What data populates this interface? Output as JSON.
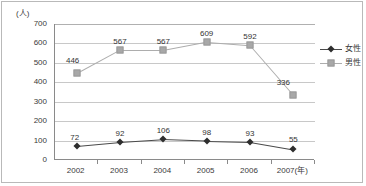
{
  "chart_data": {
    "type": "line",
    "title": "",
    "xlabel": "(年)",
    "ylabel": "(人)",
    "ylim": [
      0,
      700
    ],
    "ystep": 100,
    "grid": true,
    "legend_position": "right",
    "categories": [
      "2002",
      "2003",
      "2004",
      "2005",
      "2006",
      "2007(年)"
    ],
    "ytick_labels": [
      "0",
      "100",
      "200",
      "300",
      "400",
      "500",
      "600",
      "700"
    ],
    "series": [
      {
        "name": "女性",
        "marker": "diamond",
        "color": "#2e2e2e",
        "values": [
          72,
          92,
          106,
          98,
          93,
          55
        ]
      },
      {
        "name": "男性",
        "marker": "square",
        "color": "#a8a8a8",
        "values": [
          446,
          567,
          567,
          609,
          592,
          336
        ]
      }
    ]
  },
  "axis": {
    "unit_label": "(人)"
  },
  "legend": {
    "items": [
      {
        "label": "女性"
      },
      {
        "label": "男性"
      }
    ]
  }
}
